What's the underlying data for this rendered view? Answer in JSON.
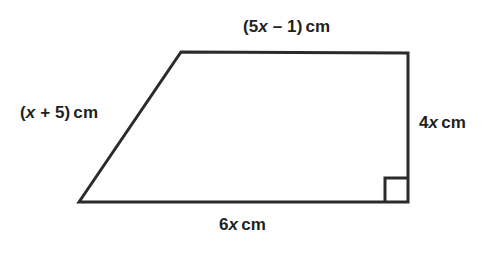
{
  "figure": {
    "name": "right-trapezoid-diagram",
    "shape_type": "trapezium",
    "background_color": "#ffffff",
    "stroke_color": "#2b2b2b",
    "stroke_width": 3,
    "labels": {
      "top": {
        "prefix": "(5",
        "var": "x",
        "suffix": " – 1)",
        "unit": "cm",
        "full": "(5x – 1) cm"
      },
      "left": {
        "prefix": "(",
        "var": "x",
        "suffix": " + 5)",
        "unit": "cm",
        "full": "(x + 5) cm"
      },
      "right": {
        "prefix": "4",
        "var": "x",
        "suffix": "",
        "unit": "cm",
        "full": "4x cm"
      },
      "bottom": {
        "prefix": "6",
        "var": "x",
        "suffix": "",
        "unit": "cm",
        "full": "6x cm"
      }
    },
    "geometry": {
      "vertices": {
        "bottom_left": [
          79,
          202
        ],
        "top_left": [
          181,
          52
        ],
        "top_right": [
          408,
          53
        ],
        "bottom_right": [
          408,
          202
        ]
      },
      "outline_points": "79,202 181,52 408,53 408,202",
      "right_angle_marker": {
        "at_vertex": "bottom_right",
        "points": "385,202 385,178 408,178",
        "size": 24
      }
    }
  }
}
